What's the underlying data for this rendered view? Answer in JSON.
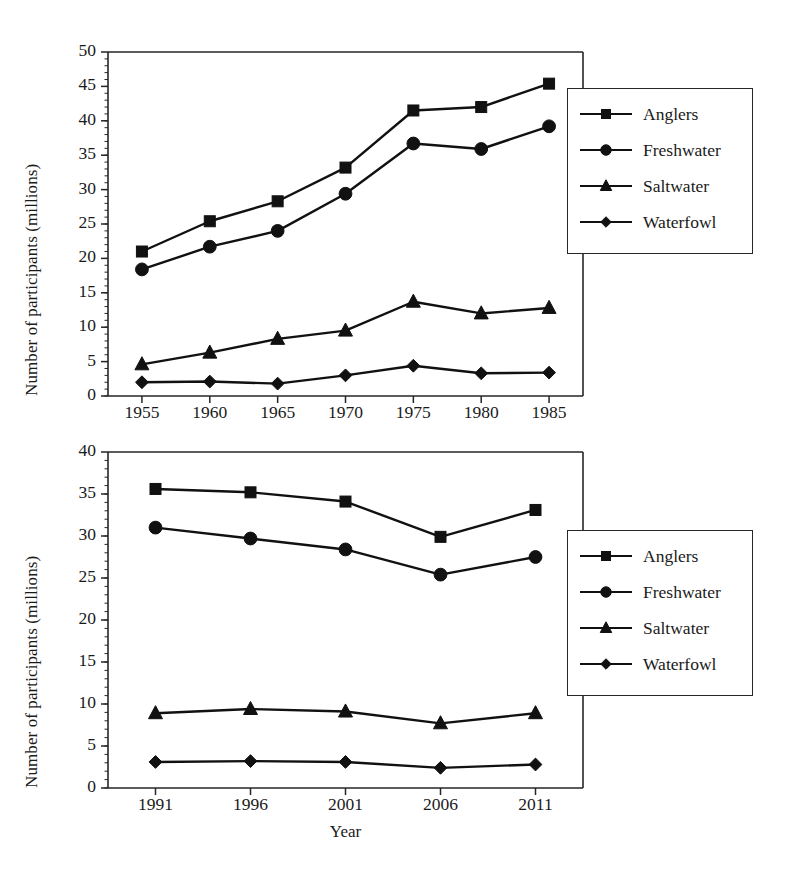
{
  "figure": {
    "background": "#ffffff",
    "line_color": "#111111",
    "axis_color": "#262626"
  },
  "chart_data": [
    {
      "type": "line",
      "panel": "top",
      "title": "",
      "xlabel": "",
      "ylabel": "Number of participants (millions)",
      "categories": [
        "1955",
        "1960",
        "1965",
        "1970",
        "1975",
        "1980",
        "1985"
      ],
      "x": [
        1955,
        1960,
        1965,
        1970,
        1975,
        1980,
        1985
      ],
      "xlim": [
        1952.5,
        1987.5
      ],
      "ylim": [
        0,
        50
      ],
      "ytick_values": [
        0,
        5,
        10,
        15,
        20,
        25,
        30,
        35,
        40,
        45,
        50
      ],
      "ytick_labels": [
        "0",
        "5",
        "10",
        "15",
        "20",
        "25",
        "30",
        "35",
        "40",
        "45",
        "50"
      ],
      "xtick_labels": [
        "1955",
        "1960",
        "1965",
        "1970",
        "1975",
        "1980",
        "1985"
      ],
      "minor_yticks": true,
      "grid": false,
      "legend_position": "right",
      "series": [
        {
          "name": "Anglers",
          "marker": "square",
          "values": [
            21.0,
            25.4,
            28.3,
            33.2,
            41.5,
            42.0,
            45.4
          ]
        },
        {
          "name": "Freshwater",
          "marker": "circle",
          "values": [
            18.4,
            21.7,
            24.0,
            29.4,
            36.7,
            35.9,
            39.2
          ]
        },
        {
          "name": "Saltwater",
          "marker": "triangle",
          "values": [
            4.6,
            6.3,
            8.3,
            9.5,
            13.7,
            12.0,
            12.8
          ]
        },
        {
          "name": "Waterfowl",
          "marker": "diamond",
          "values": [
            2.0,
            2.1,
            1.8,
            3.0,
            4.4,
            3.3,
            3.4
          ]
        }
      ]
    },
    {
      "type": "line",
      "panel": "bottom",
      "title": "",
      "xlabel": "Year",
      "ylabel": "Number of participants (millions)",
      "categories": [
        "1991",
        "1996",
        "2001",
        "2006",
        "2011"
      ],
      "x": [
        1991,
        1996,
        2001,
        2006,
        2011
      ],
      "xlim": [
        1988.5,
        2013.5
      ],
      "ylim": [
        0,
        40
      ],
      "ytick_values": [
        0,
        5,
        10,
        15,
        20,
        25,
        30,
        35,
        40
      ],
      "ytick_labels": [
        "0",
        "5",
        "10",
        "15",
        "20",
        "25",
        "30",
        "35",
        "40"
      ],
      "xtick_labels": [
        "1991",
        "1996",
        "2001",
        "2006",
        "2011"
      ],
      "minor_yticks": true,
      "grid": false,
      "legend_position": "right",
      "series": [
        {
          "name": "Anglers",
          "marker": "square",
          "values": [
            35.6,
            35.2,
            34.1,
            29.9,
            33.1
          ]
        },
        {
          "name": "Freshwater",
          "marker": "circle",
          "values": [
            31.0,
            29.7,
            28.4,
            25.4,
            27.5
          ]
        },
        {
          "name": "Saltwater",
          "marker": "triangle",
          "values": [
            8.9,
            9.4,
            9.1,
            7.7,
            8.9
          ]
        },
        {
          "name": "Waterfowl",
          "marker": "diamond",
          "values": [
            3.1,
            3.2,
            3.1,
            2.4,
            2.8
          ]
        }
      ]
    }
  ],
  "legend": {
    "entries": [
      {
        "label": "Anglers",
        "marker": "square"
      },
      {
        "label": "Freshwater",
        "marker": "circle"
      },
      {
        "label": "Saltwater",
        "marker": "triangle"
      },
      {
        "label": "Waterfowl",
        "marker": "diamond"
      }
    ]
  }
}
